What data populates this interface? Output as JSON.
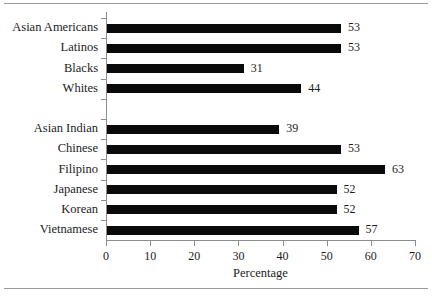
{
  "chart_data": {
    "type": "bar",
    "orientation": "horizontal",
    "title": "",
    "xlabel": "Percentage",
    "ylabel": "",
    "xlim": [
      0,
      70
    ],
    "xticks": [
      0,
      10,
      20,
      30,
      40,
      50,
      60,
      70
    ],
    "grid": false,
    "legend": null,
    "bar_color": "#0a0a0a",
    "axis_color": "#8c8c8c",
    "groups": [
      {
        "name": "",
        "categories": [
          "Asian Americans",
          "Latinos",
          "Blacks",
          "Whites"
        ],
        "values": [
          53,
          53,
          31,
          44
        ]
      },
      {
        "name": "",
        "categories": [
          "Asian Indian",
          "Chinese",
          "Filipino",
          "Japanese",
          "Korean",
          "Vietnamese"
        ],
        "values": [
          39,
          53,
          63,
          52,
          52,
          57
        ]
      }
    ],
    "categories": [
      "Asian Americans",
      "Latinos",
      "Blacks",
      "Whites",
      "Asian Indian",
      "Chinese",
      "Filipino",
      "Japanese",
      "Korean",
      "Vietnamese"
    ],
    "values": [
      53,
      53,
      31,
      44,
      39,
      53,
      63,
      52,
      52,
      57
    ],
    "data_labels": [
      "53",
      "53",
      "31",
      "44",
      "39",
      "53",
      "63",
      "52",
      "52",
      "57"
    ]
  },
  "figure": {
    "xaxis_title": "Percentage",
    "xtick_labels": [
      "0",
      "10",
      "20",
      "30",
      "40",
      "50",
      "60",
      "70"
    ],
    "category_labels": [
      "Asian Americans",
      "Latinos",
      "Blacks",
      "Whites",
      "Asian Indian",
      "Chinese",
      "Filipino",
      "Japanese",
      "Korean",
      "Vietnamese"
    ]
  }
}
